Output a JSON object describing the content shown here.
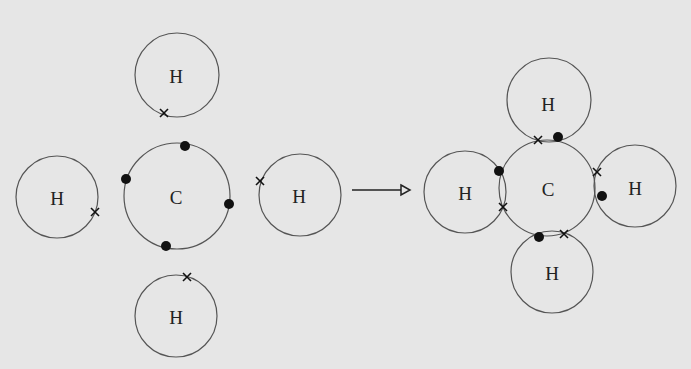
{
  "diagram": {
    "before": {
      "carbon": {
        "label": "C",
        "electrons": "dot",
        "count": 4
      },
      "hydrogens": [
        {
          "position": "top",
          "label": "H",
          "electron": "cross"
        },
        {
          "position": "left",
          "label": "H",
          "electron": "cross"
        },
        {
          "position": "right",
          "label": "H",
          "electron": "cross"
        },
        {
          "position": "bottom",
          "label": "H",
          "electron": "cross"
        }
      ]
    },
    "arrow": "reaction-arrow",
    "after": {
      "carbon": {
        "label": "C"
      },
      "hydrogens": [
        {
          "position": "top",
          "label": "H",
          "shared_pair": "cross + dot"
        },
        {
          "position": "left",
          "label": "H",
          "shared_pair": "dot + cross"
        },
        {
          "position": "right",
          "label": "H",
          "shared_pair": "cross + dot"
        },
        {
          "position": "bottom",
          "label": "H",
          "shared_pair": "dot + cross"
        }
      ]
    },
    "colors": {
      "background": "#e6e6e6",
      "stroke": "#555555",
      "electron": "#111111"
    }
  }
}
